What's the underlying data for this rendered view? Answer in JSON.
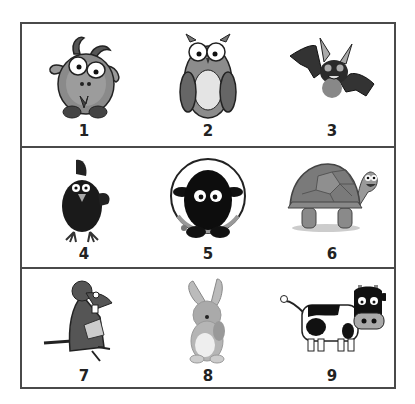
{
  "worksheet": {
    "layout": "3x3 grid",
    "cells": [
      {
        "number": "1",
        "animal": "goat-icon"
      },
      {
        "number": "2",
        "animal": "owl-icon"
      },
      {
        "number": "3",
        "animal": "bat-icon"
      },
      {
        "number": "4",
        "animal": "rooster-icon"
      },
      {
        "number": "5",
        "animal": "sheep-icon"
      },
      {
        "number": "6",
        "animal": "turtle-icon"
      },
      {
        "number": "7",
        "animal": "mouse-icon"
      },
      {
        "number": "8",
        "animal": "rabbit-icon"
      },
      {
        "number": "9",
        "animal": "cow-icon"
      }
    ]
  },
  "colors": {
    "border": "#4a4a4a",
    "label": "#222222",
    "background": "#ffffff"
  }
}
